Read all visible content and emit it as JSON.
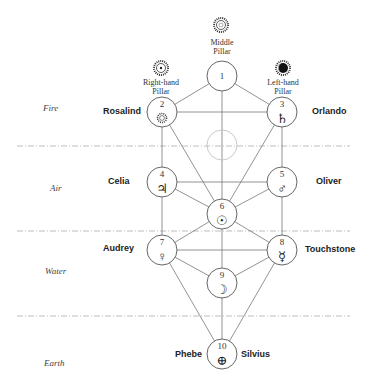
{
  "diagram": {
    "type": "tree-of-life",
    "colors": {
      "line": "#666666",
      "node_stroke": "#555555",
      "dashed": "#bbbbbb",
      "text": "#222222"
    },
    "pillars": {
      "middle": {
        "label_line1": "Middle",
        "label_line2": "Pillar",
        "icon": "sun-rayed-icon"
      },
      "right": {
        "label_line1": "Right-hand",
        "label_line2": "Pillar",
        "icon": "sun-dot-rayed-icon"
      },
      "left": {
        "label_line1": "Left-hand",
        "label_line2": "Pillar",
        "icon": "moon-eclipse-rayed-icon"
      }
    },
    "elements": [
      {
        "label": "Fire"
      },
      {
        "label": "Air"
      },
      {
        "label": "Water"
      },
      {
        "label": "Earth"
      }
    ],
    "nodes": [
      {
        "number": "1",
        "symbol": ""
      },
      {
        "number": "2",
        "symbol": "✺"
      },
      {
        "number": "3",
        "symbol": "♄"
      },
      {
        "number": "4",
        "symbol": "♃"
      },
      {
        "number": "5",
        "symbol": "♂"
      },
      {
        "number": "6",
        "symbol": "☉"
      },
      {
        "number": "7",
        "symbol": "♀"
      },
      {
        "number": "8",
        "symbol": "☿"
      },
      {
        "number": "9",
        "symbol": "☽"
      },
      {
        "number": "10",
        "symbol": "⊕"
      }
    ],
    "characters": {
      "rosalind": "Rosalind",
      "orlando": "Orlando",
      "celia": "Celia",
      "oliver": "Oliver",
      "audrey": "Audrey",
      "touchstone": "Touchstone",
      "phebe": "Phebe",
      "silvius": "Silvius"
    }
  }
}
